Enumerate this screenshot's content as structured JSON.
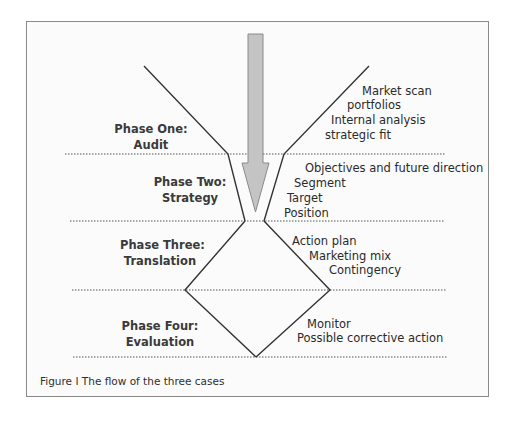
{
  "diagram": {
    "phases": [
      {
        "title": "Phase One:",
        "subtitle": "Audit"
      },
      {
        "title": "Phase Two:",
        "subtitle": "Strategy"
      },
      {
        "title": "Phase Three:",
        "subtitle": "Translation"
      },
      {
        "title": "Phase Four:",
        "subtitle": "Evaluation"
      }
    ],
    "annotations": {
      "audit": [
        "Market scan",
        "portfolios",
        "Internal analysis",
        "strategic fit"
      ],
      "strategy": [
        "Objectives and future direction",
        "Segment",
        "Target",
        "Position"
      ],
      "translation": [
        "Action plan",
        "Marketing mix",
        "Contingency"
      ],
      "evaluation": [
        "Monitor",
        "Possible corrective action"
      ]
    },
    "caption": "Figure I  The flow of the three cases",
    "colors": {
      "arrow_fill": "#c4c4c4",
      "arrow_stroke": "#8a8a8a",
      "line": "#333333",
      "frame": "#8a8a8a",
      "dotted": "#555555"
    }
  }
}
